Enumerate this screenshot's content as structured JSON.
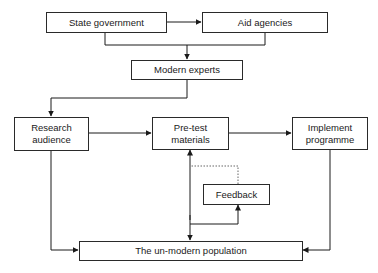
{
  "diagram": {
    "type": "flowchart",
    "nodes": {
      "state_government": "State government",
      "aid_agencies": "Aid agencies",
      "modern_experts": "Modern experts",
      "research_audience": "Research audience",
      "research_audience_line1": "Research",
      "research_audience_line2": "audience",
      "pretest_materials_line1": "Pre-test",
      "pretest_materials_line2": "materials",
      "implement_programme_line1": "Implement",
      "implement_programme_line2": "programme",
      "feedback": "Feedback",
      "unmodern_population": "The un-modern population"
    },
    "edges": [
      {
        "from": "State government",
        "to": "Aid agencies",
        "style": "bidirectional"
      },
      {
        "from": "State government + Aid agencies",
        "to": "Modern experts"
      },
      {
        "from": "Modern experts",
        "to": "Research audience"
      },
      {
        "from": "Research audience",
        "to": "Pre-test materials"
      },
      {
        "from": "Pre-test materials",
        "to": "Implement programme"
      },
      {
        "from": "Research audience",
        "to": "The un-modern population"
      },
      {
        "from": "Pre-test materials",
        "to": "The un-modern population"
      },
      {
        "from": "Implement programme",
        "to": "The un-modern population"
      },
      {
        "from": "The un-modern population (via Pre-test line)",
        "to": "Feedback"
      },
      {
        "from": "Feedback",
        "to": "Pre-test materials",
        "style": "dotted"
      }
    ]
  }
}
